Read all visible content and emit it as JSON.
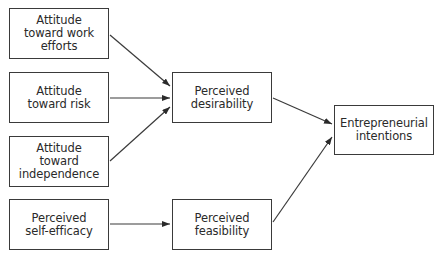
{
  "diagram": {
    "type": "flow",
    "nodes": [
      {
        "id": "work_efforts",
        "label": "Attitude\ntoward work\nefforts",
        "x": 9,
        "y": 8,
        "w": 100,
        "h": 51
      },
      {
        "id": "risk",
        "label": "Attitude\ntoward risk",
        "x": 9,
        "y": 72,
        "w": 100,
        "h": 51
      },
      {
        "id": "independence",
        "label": "Attitude\ntoward\nindependence",
        "x": 9,
        "y": 136,
        "w": 100,
        "h": 51
      },
      {
        "id": "self_efficacy",
        "label": "Perceived\nself-efficacy",
        "x": 9,
        "y": 199,
        "w": 100,
        "h": 51
      },
      {
        "id": "desirability",
        "label": "Perceived\ndesirability",
        "x": 172,
        "y": 72,
        "w": 100,
        "h": 51
      },
      {
        "id": "feasibility",
        "label": "Perceived\nfeasibility",
        "x": 172,
        "y": 199,
        "w": 100,
        "h": 51
      },
      {
        "id": "intentions",
        "label": "Entrepreneurial\nintentions",
        "x": 334,
        "y": 105,
        "w": 100,
        "h": 50
      }
    ],
    "edges": [
      {
        "from": "work_efforts",
        "to": "desirability",
        "x1": 110,
        "y1": 35,
        "x2": 170,
        "y2": 86
      },
      {
        "from": "risk",
        "to": "desirability",
        "x1": 110,
        "y1": 98,
        "x2": 170,
        "y2": 98
      },
      {
        "from": "independence",
        "to": "desirability",
        "x1": 110,
        "y1": 161,
        "x2": 170,
        "y2": 107
      },
      {
        "from": "self_efficacy",
        "to": "feasibility",
        "x1": 110,
        "y1": 224,
        "x2": 170,
        "y2": 224
      },
      {
        "from": "desirability",
        "to": "intentions",
        "x1": 273,
        "y1": 98,
        "x2": 332,
        "y2": 124
      },
      {
        "from": "feasibility",
        "to": "intentions",
        "x1": 273,
        "y1": 222,
        "x2": 332,
        "y2": 137
      }
    ],
    "colors": {
      "stroke": "#3a3a3a",
      "text": "#2a2a2a",
      "background": "#ffffff"
    }
  }
}
